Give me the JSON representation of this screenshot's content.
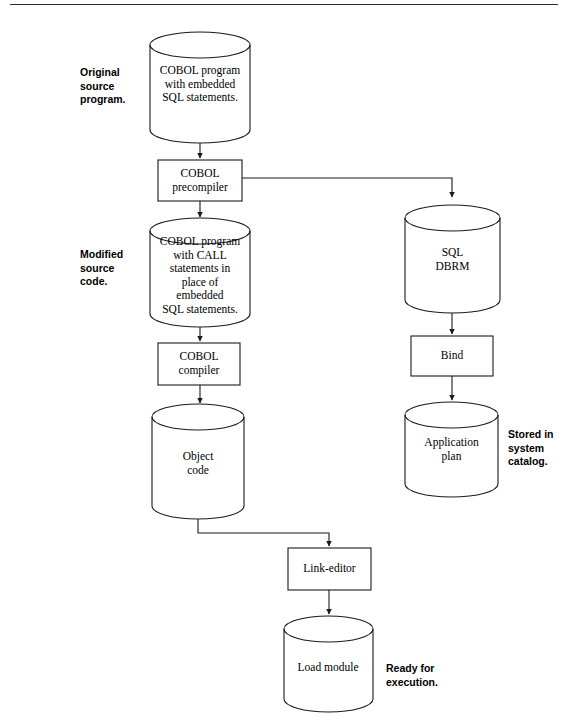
{
  "page": {
    "top_rule_color": "#2b2b2b",
    "background_color": "#ffffff",
    "stroke_color": "#1a1a1a",
    "fill_color": "#ffffff"
  },
  "diagram": {
    "type": "flowchart",
    "orientation": "top-to-bottom",
    "nodes": [
      {
        "id": "source-program",
        "shape": "cylinder",
        "label": "COBOL program\nwith embedded\nSQL statements.",
        "column": "left"
      },
      {
        "id": "cobol-precompiler",
        "shape": "rectangle",
        "label": "COBOL\nprecompiler",
        "column": "left"
      },
      {
        "id": "modified-source",
        "shape": "cylinder",
        "label": "COBOL program\nwith CALL\nstatements in\nplace of\nembedded\nSQL statements.",
        "column": "left"
      },
      {
        "id": "cobol-compiler",
        "shape": "rectangle",
        "label": "COBOL\ncompiler",
        "column": "left"
      },
      {
        "id": "object-code",
        "shape": "cylinder",
        "label": "Object\ncode",
        "column": "left"
      },
      {
        "id": "sql-dbrm",
        "shape": "cylinder",
        "label": "SQL\nDBRM",
        "column": "right"
      },
      {
        "id": "bind",
        "shape": "rectangle",
        "label": "Bind",
        "column": "right"
      },
      {
        "id": "application-plan",
        "shape": "cylinder",
        "label": "Application\nplan",
        "column": "right"
      },
      {
        "id": "link-editor",
        "shape": "rectangle",
        "label": "Link-editor",
        "column": "center"
      },
      {
        "id": "load-module",
        "shape": "cylinder",
        "label": "Load module",
        "column": "center"
      }
    ],
    "annotations": [
      {
        "id": "original-source-note",
        "label": "Original\nsource\nprogram.",
        "anchor": "source-program"
      },
      {
        "id": "modified-source-note",
        "label": "Modified\nsource\ncode.",
        "anchor": "modified-source"
      },
      {
        "id": "stored-in-catalog-note",
        "label": "Stored in\nsystem\ncatalog.",
        "anchor": "application-plan"
      },
      {
        "id": "ready-for-execution-note",
        "label": "Ready for\nexecution.",
        "anchor": "load-module"
      }
    ],
    "edges": [
      {
        "from": "source-program",
        "to": "cobol-precompiler",
        "style": "straight-arrow"
      },
      {
        "from": "cobol-precompiler",
        "to": "modified-source",
        "style": "straight-arrow"
      },
      {
        "from": "cobol-precompiler",
        "to": "sql-dbrm",
        "style": "elbow-arrow"
      },
      {
        "from": "modified-source",
        "to": "cobol-compiler",
        "style": "straight-arrow"
      },
      {
        "from": "cobol-compiler",
        "to": "object-code",
        "style": "straight-arrow"
      },
      {
        "from": "object-code",
        "to": "link-editor",
        "style": "elbow-arrow"
      },
      {
        "from": "sql-dbrm",
        "to": "bind",
        "style": "straight-arrow"
      },
      {
        "from": "bind",
        "to": "application-plan",
        "style": "straight-arrow"
      },
      {
        "from": "link-editor",
        "to": "load-module",
        "style": "straight-arrow"
      }
    ]
  }
}
